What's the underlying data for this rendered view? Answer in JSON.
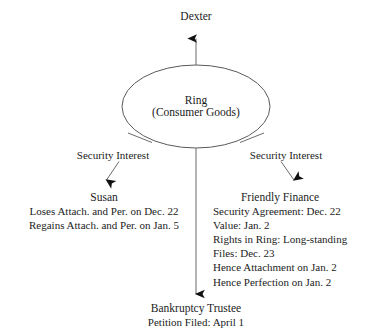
{
  "diagram": {
    "title_node": {
      "label": "Dexter"
    },
    "center_node": {
      "line1": "Ring",
      "line2": "(Consumer Goods)"
    },
    "edges": {
      "left_security_interest": "Security Interest",
      "right_security_interest": "Security Interest"
    },
    "left_party": {
      "name": "Susan",
      "details": [
        "Loses Attach. and Per. on Dec. 22",
        "Regains Attach. and Per. on Jan. 5"
      ]
    },
    "right_party": {
      "name": "Friendly Finance",
      "details": [
        "Security Agreement: Dec. 22",
        "Value: Jan. 2",
        "Rights in Ring: Long-standing",
        "Files: Dec. 23",
        "Hence Attachment on Jan. 2",
        "Hence Perfection on Jan. 2"
      ]
    },
    "bottom_party": {
      "name": "Bankruptcy Trustee",
      "details": [
        "Petition Filed: April 1"
      ]
    },
    "colors": {
      "stroke": "#555555",
      "arrowhead": "#111111",
      "text": "#232323",
      "background": "#ffffff"
    }
  }
}
